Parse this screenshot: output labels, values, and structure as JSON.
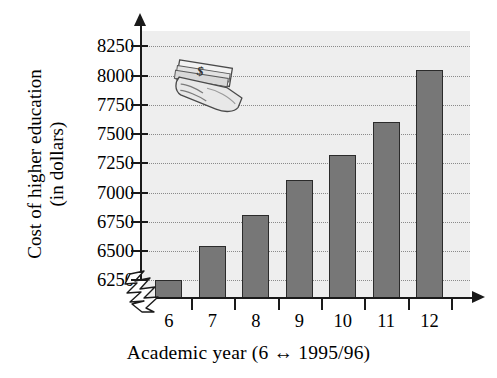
{
  "chart_data": {
    "type": "bar",
    "title": "",
    "xlabel": "Academic year (6 ↔ 1995/96)",
    "ylabel_line1": "Cost of higher education",
    "ylabel_line2": "(in dollars)",
    "categories": [
      "6",
      "7",
      "8",
      "9",
      "10",
      "11",
      "12"
    ],
    "values": [
      6250,
      6540,
      6810,
      7110,
      7320,
      7600,
      8050
    ],
    "yticks": [
      6250,
      6500,
      6750,
      7000,
      7250,
      7500,
      7750,
      8000,
      8250
    ],
    "ytick_labels": [
      "6250",
      "6500",
      "6750",
      "7000",
      "7250",
      "7500",
      "7750",
      "8000",
      "8250"
    ],
    "ylim": [
      6100,
      8380
    ],
    "grid": true,
    "grid_style": "dotted",
    "axis_break": true,
    "legend": "none",
    "series": [
      {
        "name": "Cost of higher education",
        "values": [
          6250,
          6540,
          6810,
          7110,
          7320,
          7600,
          8050
        ]
      }
    ]
  },
  "figure": {
    "plot_background": "#eeeeee",
    "bar_fill": "#777777",
    "bar_outline": "#2b2b2b",
    "axis_color": "#1a1a1a",
    "grid_color": "#8a8a8a"
  },
  "decoration": {
    "money_icon": "hand-holding-cash-icon",
    "currency_symbol": "$"
  }
}
